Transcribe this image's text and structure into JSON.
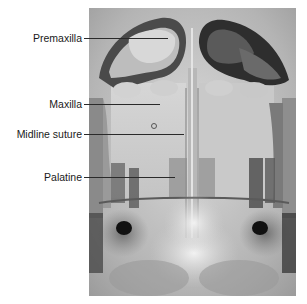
{
  "figure": {
    "type": "radiograph",
    "labels": [
      {
        "id": "premaxilla",
        "text": "Premaxilla"
      },
      {
        "id": "maxilla",
        "text": "Maxilla"
      },
      {
        "id": "midline-suture",
        "text": "Midline suture"
      },
      {
        "id": "palatine",
        "text": "Palatine"
      }
    ]
  },
  "colors": {
    "background": "#ffffff",
    "label_text": "#1a1a1a",
    "leader_line": "#2a2a2a"
  }
}
